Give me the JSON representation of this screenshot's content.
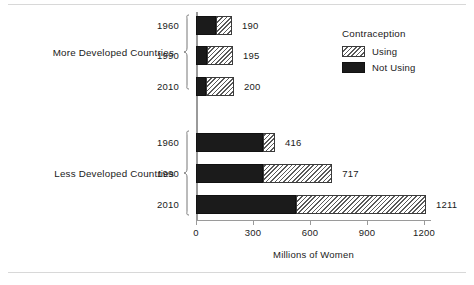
{
  "chart_data": {
    "type": "bar",
    "orientation": "horizontal",
    "stacked": true,
    "title": "",
    "xlabel": "Millions of Women",
    "ylabel": "",
    "xlim": [
      0,
      1250
    ],
    "xticks": [
      0,
      300,
      600,
      900,
      1200
    ],
    "xtick_labels": [
      "0",
      "300",
      "600",
      "900",
      "1200"
    ],
    "grid": false,
    "legend": {
      "title": "Contraception",
      "position": "top-right",
      "entries": [
        {
          "label": "Using",
          "fill": "hatched",
          "color": "#ffffff"
        },
        {
          "label": "Not Using",
          "fill": "solid",
          "color": "#1b1b1b"
        }
      ]
    },
    "series": [
      {
        "name": "Not Using",
        "values": [
          105,
          60,
          55,
          353,
          350,
          526
        ]
      },
      {
        "name": "Using",
        "values": [
          85,
          135,
          145,
          63,
          367,
          685
        ]
      }
    ],
    "groups": [
      {
        "label": "More Developed Countries",
        "categories": [
          "1960",
          "1990",
          "2010"
        ],
        "bars": [
          {
            "year": "1960",
            "not_using": 105,
            "using": 85,
            "total": 190,
            "total_label": "190"
          },
          {
            "year": "1990",
            "not_using": 60,
            "using": 135,
            "total": 195,
            "total_label": "195"
          },
          {
            "year": "2010",
            "not_using": 55,
            "using": 145,
            "total": 200,
            "total_label": "200"
          }
        ]
      },
      {
        "label": "Less Developed Countries",
        "categories": [
          "1960",
          "1990",
          "2010"
        ],
        "bars": [
          {
            "year": "1960",
            "not_using": 353,
            "using": 63,
            "total": 416,
            "total_label": "416"
          },
          {
            "year": "1990",
            "not_using": 350,
            "using": 367,
            "total": 717,
            "total_label": "717"
          },
          {
            "year": "2010",
            "not_using": 526,
            "using": 685,
            "total": 1211,
            "total_label": "1211"
          }
        ]
      }
    ]
  },
  "axis": {
    "x_title": "Millions of Women",
    "ticks": [
      {
        "value": 0,
        "label": "0"
      },
      {
        "value": 300,
        "label": "300"
      },
      {
        "value": 600,
        "label": "600"
      },
      {
        "value": 900,
        "label": "900"
      },
      {
        "value": 1200,
        "label": "1200"
      }
    ]
  },
  "legend": {
    "title": "Contraception",
    "using_label": "Using",
    "not_using_label": "Not Using"
  },
  "groups": {
    "more": {
      "label": "More Developed Countries",
      "years": [
        "1960",
        "1990",
        "2010"
      ],
      "totals": [
        "190",
        "195",
        "200"
      ]
    },
    "less": {
      "label": "Less Developed Countries",
      "years": [
        "1960",
        "1990",
        "2010"
      ],
      "totals": [
        "416",
        "717",
        "1211"
      ]
    }
  },
  "colors": {
    "not_using": "#1b1b1b",
    "using_hatch": "#5a5a5a",
    "axis": "#9a9a9a",
    "text": "#1a1a1a",
    "rule": "#d8d8d8"
  }
}
